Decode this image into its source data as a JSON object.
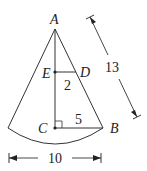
{
  "diagram": {
    "type": "cone",
    "points": {
      "A": "A",
      "B": "B",
      "C": "C",
      "D": "D",
      "E": "E"
    },
    "measurements": {
      "slant_height": "13",
      "radius_base": "5",
      "small_radius": "2",
      "diameter": "10"
    }
  }
}
